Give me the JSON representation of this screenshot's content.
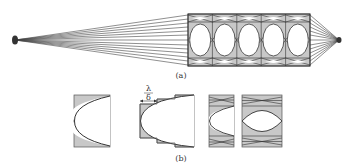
{
  "figure": {
    "panel_a": {
      "label": "(a)",
      "cells": 5,
      "source_dot": {
        "cx": 15,
        "cy": 40
      },
      "sink_dot": {
        "cx": 339,
        "cy": 40
      },
      "box": {
        "x": 188,
        "y": 14,
        "w": 122,
        "h": 52
      }
    },
    "panel_b": {
      "label": "(b)",
      "annotation": {
        "numerator": "λ",
        "denominator": "δ"
      }
    },
    "colors": {
      "fill_gray": "#c8c8c8",
      "line": "#333333",
      "background": "#ffffff"
    }
  }
}
